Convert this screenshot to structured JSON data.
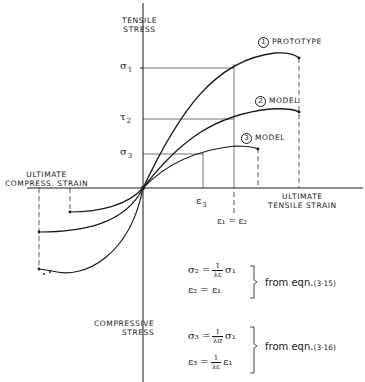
{
  "axes": {
    "y_top_label": [
      "TENSILE",
      "STRESS"
    ],
    "y_bottom_label": [
      "COMPRESSIVE",
      "STRESS"
    ],
    "x_right_label": [
      "ULTIMATE",
      "TENSILE STRAIN"
    ],
    "x_left_label": [
      "ULTIMATE",
      "COMPRESS. STRAIN"
    ]
  },
  "curves": [
    {
      "num": "1",
      "name": "PROTOTYPE"
    },
    {
      "num": "2",
      "name": "MODEL"
    },
    {
      "num": "3",
      "name": "MODEL"
    }
  ],
  "y_ticks": {
    "s1": "σ",
    "s1_sub": "1",
    "s2": "τ",
    "s2_sub": "2",
    "s3": "σ",
    "s3_sub": "3"
  },
  "x_ticks": {
    "e3": "ε",
    "e3_sub": "3",
    "e12": "ε₁ = ε₂"
  },
  "equations": {
    "group1": {
      "line1_lhs": "σ₂ =",
      "line1_num": "1",
      "line1_den": "λε",
      "line1_rhs": "σ₁",
      "line2": "ε₂ = ε₁",
      "from": "from  eqn.",
      "ref": "(3·15)"
    },
    "group2": {
      "line1_lhs": "σ₃ =",
      "line1_num": "1",
      "line1_den": "λσ",
      "line1_rhs": "σ₁",
      "line2_lhs": "ε₃ =",
      "line2_num": "1",
      "line2_den": "λε",
      "line2_rhs": "ε₁",
      "from": "from  eqn.",
      "ref": "(3·16)"
    }
  }
}
